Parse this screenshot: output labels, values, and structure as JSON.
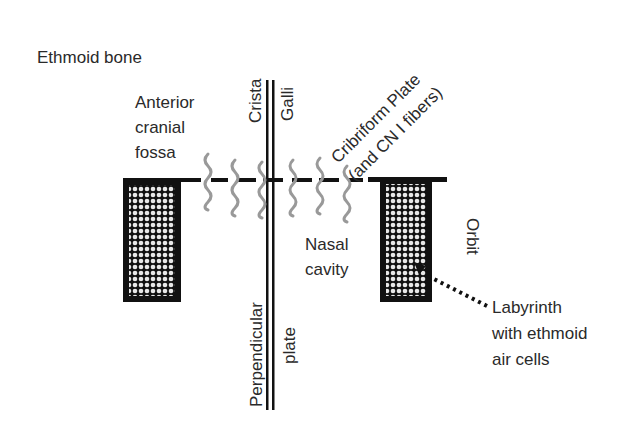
{
  "diagram": {
    "title": "Ethmoid bone",
    "colors": {
      "bone": "#111111",
      "fibers": "#999999",
      "text": "#2a2a2a",
      "background": "#ffffff"
    },
    "labels": {
      "anterior_cranial_fossa": [
        "Anterior",
        "cranial",
        "fossa"
      ],
      "crista": "Crista",
      "galli": "Galli",
      "cribriform_line1": "Cribriform Plate",
      "cribriform_line2": "(and CN I fibers)",
      "nasal_cavity": [
        "Nasal",
        "cavity"
      ],
      "orbit": "Orbit",
      "perpendicular": "Perpendicular",
      "plate": "plate",
      "labyrinth": [
        "Labyrinth",
        "with ethmoid",
        "air cells"
      ]
    },
    "structures": [
      "Crista galli",
      "Cribriform plate with CN I fibers",
      "Perpendicular plate",
      "Ethmoid labyrinth (air cells)"
    ]
  }
}
